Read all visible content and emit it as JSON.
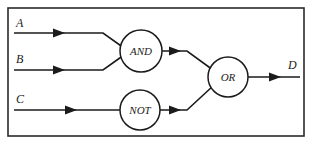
{
  "diagram": {
    "type": "logic-circuit",
    "background_color": "#ffffff",
    "line_color": "#1b1b1b",
    "frame": {
      "name": "outer-border",
      "x": 8,
      "y": 8,
      "width": 296,
      "height": 128
    },
    "inputs": [
      {
        "id": "A",
        "label": "A",
        "label_x": 16,
        "label_y": 27,
        "wire_y": 33,
        "wire_x_start": 14,
        "wire_x_end": 103,
        "arrow_x": 62
      },
      {
        "id": "B",
        "label": "B",
        "label_x": 16,
        "label_y": 63,
        "wire_y": 70,
        "wire_x_start": 14,
        "wire_x_end": 103,
        "arrow_x": 62
      },
      {
        "id": "C",
        "label": "C",
        "label_x": 16,
        "label_y": 103,
        "wire_y": 110,
        "wire_x_start": 14,
        "wire_x_end": 120,
        "arrow_x": 74
      }
    ],
    "outputs": [
      {
        "id": "D",
        "label": "D",
        "label_x": 288,
        "label_y": 68,
        "wire_y": 77,
        "wire_x_start": 248,
        "wire_x_end": 300,
        "arrow_x": 278
      }
    ],
    "gates": [
      {
        "id": "and-gate",
        "label": "AND",
        "cx": 141,
        "cy": 51,
        "r": 21
      },
      {
        "id": "not-gate",
        "label": "NOT",
        "cx": 140,
        "cy": 110,
        "r": 20
      },
      {
        "id": "or-gate",
        "label": "OR",
        "cx": 228,
        "cy": 77,
        "r": 20
      }
    ],
    "connections": [
      {
        "id": "a-to-and",
        "from": "A",
        "to": "and-gate",
        "path": "M 14 33 L 103 33 L 124 48"
      },
      {
        "id": "b-to-and",
        "from": "B",
        "to": "and-gate",
        "path": "M 14 70 L 103 70 L 124 55"
      },
      {
        "id": "c-to-not",
        "from": "C",
        "to": "not-gate",
        "path": "M 14 110 L 120 110"
      },
      {
        "id": "and-to-or",
        "from": "and-gate",
        "to": "or-gate",
        "path": "M 162 51 L 186 51 L 212 70"
      },
      {
        "id": "not-to-or",
        "from": "not-gate",
        "to": "or-gate",
        "path": "M 160 110 L 186 110 L 212 86"
      },
      {
        "id": "or-to-d",
        "from": "or-gate",
        "to": "D",
        "path": "M 248 77 L 300 77"
      }
    ],
    "arrows": [
      {
        "id": "arrow-a",
        "x": 62,
        "y": 33
      },
      {
        "id": "arrow-b",
        "x": 62,
        "y": 70
      },
      {
        "id": "arrow-c",
        "x": 74,
        "y": 110
      },
      {
        "id": "arrow-and-out",
        "x": 178,
        "y": 51
      },
      {
        "id": "arrow-not-out",
        "x": 178,
        "y": 110
      },
      {
        "id": "arrow-d-out",
        "x": 278,
        "y": 77
      }
    ]
  }
}
